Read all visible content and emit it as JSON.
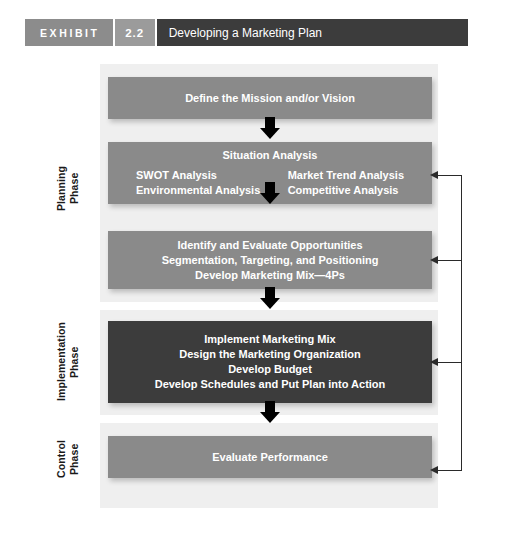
{
  "header": {
    "exhibit_label": "EXHIBIT",
    "exhibit_number": "2.2",
    "title": "Developing a Marketing Plan",
    "tag_color": "#8c8c8c",
    "number_color": "#9b9b9b",
    "title_bar_color": "#3c3c3c"
  },
  "phases": {
    "planning": "Planning\nPhase",
    "planning_line1": "Planning",
    "planning_line2": "Phase",
    "implementation_line1": "Implementation",
    "implementation_line2": "Phase",
    "control_line1": "Control",
    "control_line2": "Phase"
  },
  "colors": {
    "box_fill": "#8a8a8a",
    "box_fill_dark": "#3c3c3c",
    "panel_fill": "#efefef",
    "text": "#ffffff",
    "arrow": "#000000",
    "feedback": "#2a2a2a"
  },
  "steps": {
    "mission": {
      "text": "Define the Mission and/or Vision"
    },
    "situation": {
      "heading": "Situation Analysis",
      "left_line1": "SWOT Analysis",
      "left_line2": "Environmental Analysis",
      "right_line1": "Market Trend Analysis",
      "right_line2": "Competitive Analysis"
    },
    "identify": {
      "line1": "Identify and Evaluate Opportunities",
      "line2": "Segmentation, Targeting, and Positioning",
      "line3": "Develop Marketing Mix—4Ps"
    },
    "implement": {
      "line1": "Implement Marketing Mix",
      "line2": "Design the Marketing Organization",
      "line3": "Develop Budget",
      "line4": "Develop Schedules and Put Plan into Action"
    },
    "evaluate": {
      "text": "Evaluate Performance"
    }
  }
}
